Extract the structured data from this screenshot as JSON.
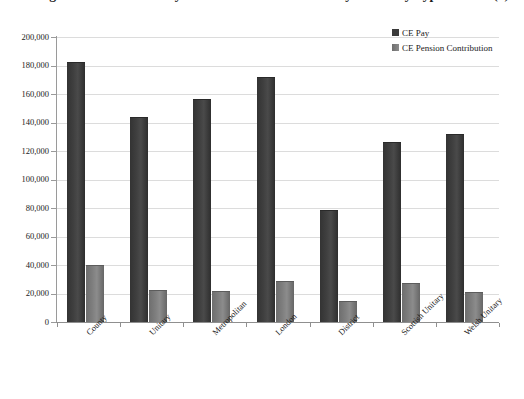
{
  "chart_data": {
    "type": "bar",
    "title": "Average Chief Executive Pay and Pension Contribution by Authority Type 2010/11 (£)",
    "xlabel": "",
    "ylabel": "",
    "ylim": [
      0,
      200000
    ],
    "ytick_step": 20000,
    "grid": true,
    "legend_position": "top-right",
    "categories": [
      "County",
      "Unitary",
      "Metropolitan",
      "London",
      "District",
      "Scottish Unitary",
      "Welsh Unitary"
    ],
    "series": [
      {
        "name": "CE Pay",
        "color": "#3a3a3a",
        "values": [
          182000,
          143000,
          156000,
          171000,
          78000,
          125500,
          131500
        ]
      },
      {
        "name": "CE Pension Contribution",
        "color": "#7e7e7e",
        "values": [
          39000,
          21500,
          21000,
          28000,
          14000,
          26500,
          20500
        ]
      }
    ],
    "ytick_labels": [
      "200,000",
      "180,000",
      "160,000",
      "140,000",
      "120,000",
      "100,000",
      "80,000",
      "60,000",
      "40,000",
      "20,000",
      "0"
    ]
  },
  "legend": {
    "items": [
      {
        "label": "CE Pay"
      },
      {
        "label": "CE Pension Contribution"
      }
    ]
  }
}
